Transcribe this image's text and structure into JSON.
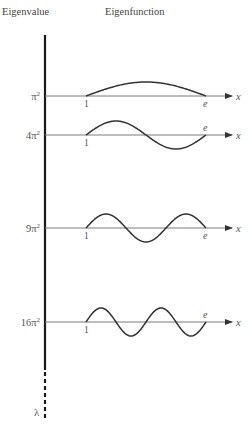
{
  "header": {
    "eigenvalue_label": "Eigenvalue",
    "eigenfunction_label": "Eigenfunction"
  },
  "colors": {
    "axis": "#1a1a1a",
    "curve": "#333333",
    "baseline": "#7a7a7a",
    "text": "#555555"
  },
  "axis": {
    "lambda_symbol": "λ",
    "x_symbol": "x",
    "left_tick": "1",
    "right_tick": "e"
  },
  "rows": [
    {
      "n": 1,
      "eigenvalue": "π²",
      "coef": "",
      "function": "sin(π ln x)",
      "e_label_position": "below"
    },
    {
      "n": 2,
      "eigenvalue": "4π²",
      "coef": "4",
      "function": "sin(2π ln x)",
      "e_label_position": "above"
    },
    {
      "n": 3,
      "eigenvalue": "9π²",
      "coef": "9",
      "function": "sin(3π ln x)",
      "e_label_position": "below"
    },
    {
      "n": 4,
      "eigenvalue": "16π²",
      "coef": "16",
      "function": "sin(4π ln x)",
      "e_label_position": "above"
    }
  ],
  "chart_data": {
    "type": "line",
    "title": "",
    "xlabel": "x",
    "ylabel": "λ",
    "x_domain": [
      1,
      2.71828
    ],
    "x_tick_labels": [
      "1",
      "e"
    ],
    "series": [
      {
        "name": "π²",
        "eigenvalue": 9.8696,
        "formula": "y = sin(π ln x)",
        "zeros_interior": 0
      },
      {
        "name": "4π²",
        "eigenvalue": 39.4784,
        "formula": "y = sin(2π ln x)",
        "zeros_interior": 1
      },
      {
        "name": "9π²",
        "eigenvalue": 88.8264,
        "formula": "y = sin(3π ln x)",
        "zeros_interior": 2
      },
      {
        "name": "16π²",
        "eigenvalue": 157.9137,
        "formula": "y = sin(4π ln x)",
        "zeros_interior": 3
      }
    ],
    "column_headers": [
      "Eigenvalue",
      "Eigenfunction"
    ],
    "vertical_axis": {
      "label": "λ",
      "continues": "dashed"
    }
  }
}
